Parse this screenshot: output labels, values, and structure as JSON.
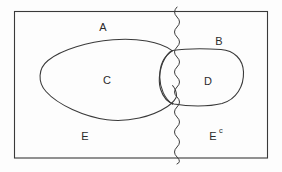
{
  "figure": {
    "type": "set-diagram",
    "background_color": "#fdfdfd",
    "stroke_color": "#3a3a3a",
    "shade_color": "#6e6e6e"
  },
  "labels": {
    "a": "A",
    "b": "B",
    "c": "C",
    "d": "D",
    "e": "E",
    "e_complement_base": "E",
    "e_complement_sup": "c"
  },
  "shapes": {
    "universe_rect": "rectangle",
    "set_c_ellipse": "ellipse",
    "set_d_blob": "rounded-blob-shaded",
    "divider": "wavy-vertical-line"
  }
}
